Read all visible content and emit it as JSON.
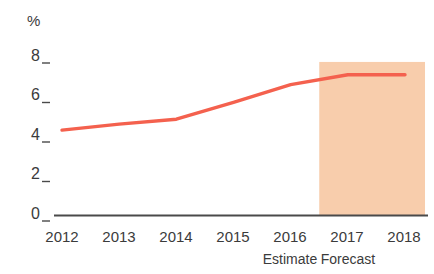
{
  "chart_data": {
    "type": "line",
    "title": "",
    "subtitle": "",
    "xlabel": "",
    "ylabel": "%",
    "unit_label": "%",
    "categories": [
      "2012",
      "2013",
      "2014",
      "2015",
      "2016",
      "2017",
      "2018"
    ],
    "x": [
      2012,
      2013,
      2014,
      2015,
      2016,
      2017,
      2018
    ],
    "values": [
      4.3,
      4.6,
      4.85,
      5.7,
      6.6,
      7.1,
      7.1
    ],
    "series": [
      {
        "name": "",
        "values": [
          4.3,
          4.6,
          4.85,
          5.7,
          6.6,
          7.1,
          7.1
        ],
        "color": "#F4614E"
      }
    ],
    "ylim": [
      0,
      8
    ],
    "yticks": [
      0,
      2,
      4,
      6,
      8
    ],
    "ytick_labels": [
      "0",
      "2",
      "4",
      "6",
      "8"
    ],
    "xlim": [
      2012,
      2018
    ],
    "grid": false,
    "legend": "none",
    "annotations": [
      {
        "name": "estimate",
        "label": "Estimate",
        "at_category": "2016"
      },
      {
        "name": "forecast",
        "label": "Forecast",
        "at_category": "2017"
      }
    ],
    "shaded_band": {
      "label": "forecast-region",
      "from_x": 2016.5,
      "to_x": 2018.35,
      "from_y": 0,
      "to_y": 7.75,
      "color": "#F8CDAC"
    }
  },
  "colors": {
    "line": "#F4614E",
    "band": "#F8CDAC",
    "axis": "#4a4a4a",
    "text": "#3b3b3b",
    "background": "#ffffff"
  }
}
